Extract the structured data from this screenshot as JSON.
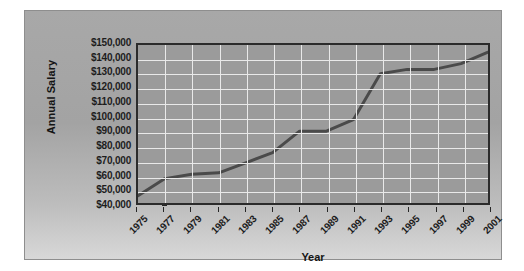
{
  "chart_data": {
    "type": "line",
    "title": "",
    "xlabel": "Year",
    "ylabel": "Annual Salary",
    "x": [
      1975,
      1977,
      1979,
      1981,
      1983,
      1985,
      1987,
      1989,
      1991,
      1993,
      1995,
      1997,
      1999,
      2001
    ],
    "values": [
      45000,
      57000,
      60000,
      61000,
      68000,
      75000,
      90000,
      90000,
      98000,
      130000,
      133000,
      133000,
      137000,
      145000
    ],
    "series": [
      {
        "name": "Annual Salary",
        "values": [
          45000,
          57000,
          60000,
          61000,
          68000,
          75000,
          90000,
          90000,
          98000,
          130000,
          133000,
          133000,
          137000,
          145000
        ]
      }
    ],
    "xlim": [
      1975,
      2001
    ],
    "ylim": [
      40000,
      150000
    ],
    "x_tick_labels": [
      "1975",
      "1977",
      "1979",
      "1981",
      "1983",
      "1985",
      "1987",
      "1989",
      "1991",
      "1993",
      "1995",
      "1997",
      "1999",
      "2001"
    ],
    "y_tick_labels": [
      "$150,000",
      "$140,000",
      "$130,000",
      "$120,000",
      "$110,000",
      "$100,000",
      "$90,000",
      "$80,000",
      "$70,000",
      "$60,000",
      "$50,000",
      "$40,000"
    ],
    "y_tick_values": [
      150000,
      140000,
      130000,
      120000,
      110000,
      100000,
      90000,
      80000,
      70000,
      60000,
      50000,
      40000
    ],
    "grid": true,
    "legend": false,
    "legend_position": "none",
    "colors": {
      "plot_background": "#9b9b9b",
      "figure_background": "#a8a8a8",
      "gridline": "#e9e9e9",
      "axis": "#2b2b2b",
      "line": "#4a4a4a",
      "text": "#1d1d1d"
    }
  }
}
